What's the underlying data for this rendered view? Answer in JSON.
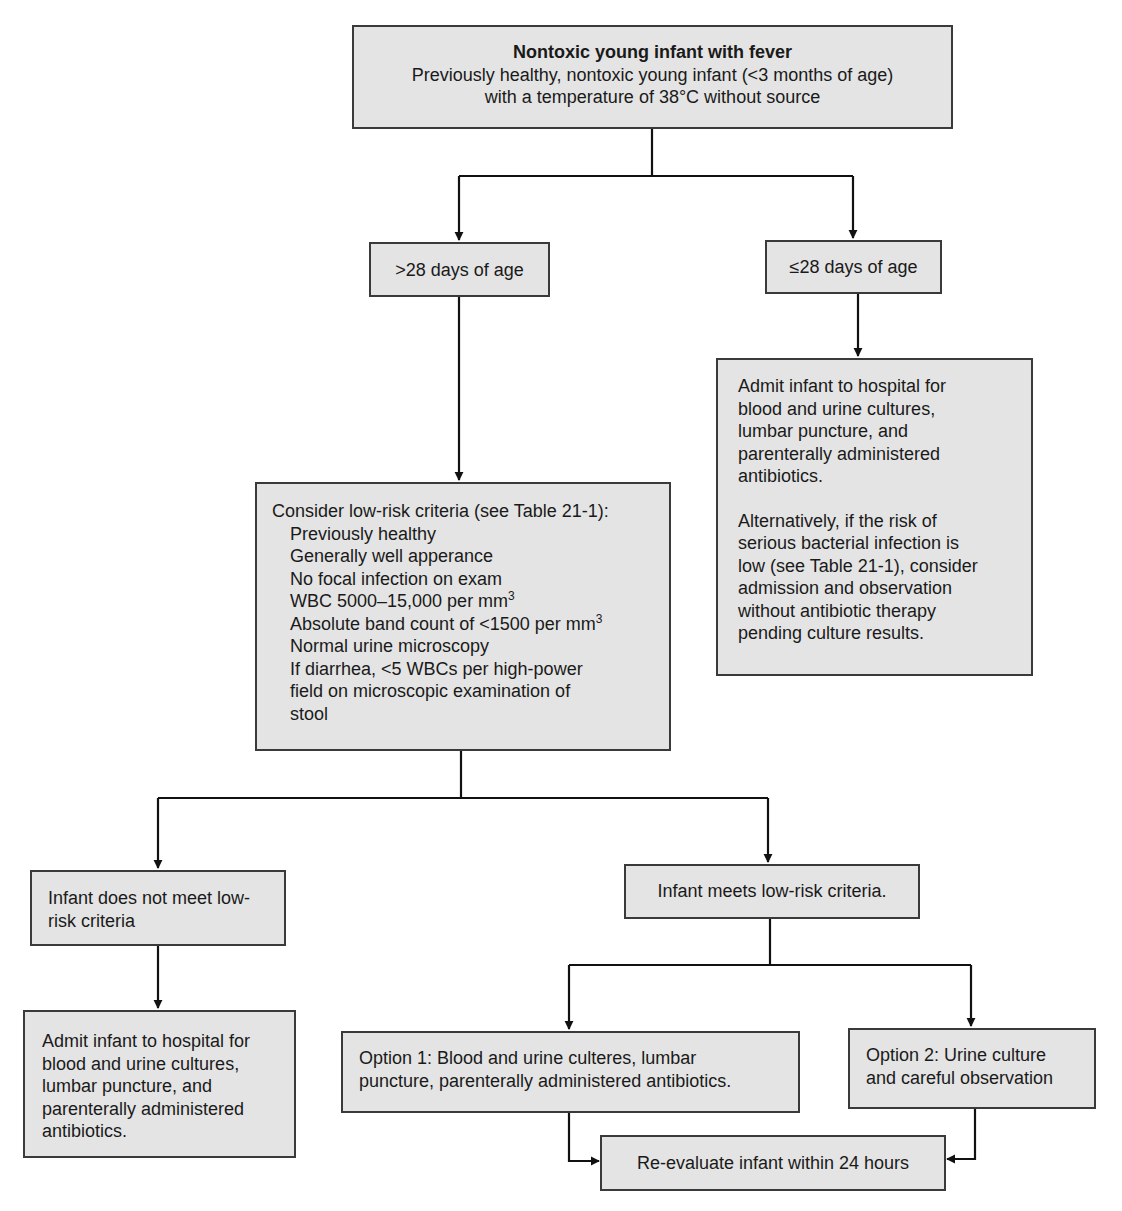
{
  "colors": {
    "box_fill": "#e4e4e4",
    "box_border": "#3a3a3a",
    "line": "#111111",
    "background": "#ffffff"
  },
  "nodes": {
    "root": {
      "title": "Nontoxic young infant with fever",
      "lines": [
        "Previously healthy, nontoxic young infant (<3 months of age)",
        "with a temperature of 38°C without source"
      ]
    },
    "gt28": {
      "label": ">28 days of age"
    },
    "le28": {
      "label": "≤28 days of age"
    },
    "le28_action": {
      "para1": [
        "Admit infant to hospital for",
        "blood and urine cultures,",
        "lumbar puncture, and",
        "parenterally administered",
        "antibiotics."
      ],
      "para2": [
        "Alternatively, if the risk of",
        "serious bacterial infection is",
        "low (see Table 21-1), consider",
        "admission and observation",
        "without antibiotic therapy",
        "pending culture results."
      ]
    },
    "criteria": {
      "heading": "Consider low-risk criteria (see Table 21-1):",
      "items": [
        "Previously healthy",
        "Generally well apperance",
        "No focal infection on exam",
        "WBC 5000–15,000 per mm",
        "Absolute band count of <1500 per mm",
        "Normal urine microscopy",
        "If diarrhea, <5 WBCs per high-power",
        "field on microscopic examination of",
        "stool"
      ],
      "superscript": "3"
    },
    "not_low_risk": {
      "lines": [
        "Infant does not meet low-",
        "risk criteria"
      ]
    },
    "not_low_risk_action": {
      "lines": [
        "Admit infant to hospital for",
        "blood and urine cultures,",
        "lumbar puncture, and",
        "parenterally administered",
        "antibiotics."
      ]
    },
    "low_risk": {
      "label": "Infant meets low-risk criteria."
    },
    "option1": {
      "lines": [
        "Option 1: Blood and urine culteres, lumbar",
        "puncture, parenterally administered antibiotics."
      ]
    },
    "option2": {
      "lines": [
        "Option 2: Urine culture",
        "and careful observation"
      ]
    },
    "reevaluate": {
      "label": "Re-evaluate infant within 24 hours"
    }
  }
}
